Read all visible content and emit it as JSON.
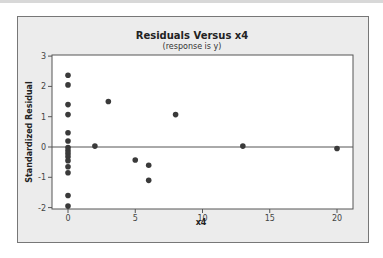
{
  "chart_data": {
    "type": "scatter",
    "title": "Residuals Versus x4",
    "subtitle": "(response is y)",
    "xlabel": "x4",
    "ylabel": "Standardized Residual",
    "xlim": [
      -1.2,
      21.2
    ],
    "ylim": [
      -2.1,
      3
    ],
    "xticks": [
      0,
      5,
      10,
      15,
      20
    ],
    "yticks": [
      -2,
      -1,
      0,
      1,
      2,
      3
    ],
    "reference_line_y": 0,
    "grid": false,
    "points": [
      {
        "x": 0,
        "y": 2.37
      },
      {
        "x": 0,
        "y": 2.05
      },
      {
        "x": 0,
        "y": 1.4
      },
      {
        "x": 0,
        "y": 1.07
      },
      {
        "x": 0,
        "y": 0.47
      },
      {
        "x": 0,
        "y": 0.2
      },
      {
        "x": 0,
        "y": -0.02
      },
      {
        "x": 0,
        "y": -0.12
      },
      {
        "x": 0,
        "y": -0.22
      },
      {
        "x": 0,
        "y": -0.32
      },
      {
        "x": 0,
        "y": -0.45
      },
      {
        "x": 0,
        "y": -0.65
      },
      {
        "x": 0,
        "y": -0.85
      },
      {
        "x": 0,
        "y": -1.6
      },
      {
        "x": 0,
        "y": -1.95
      },
      {
        "x": 2,
        "y": 0.03
      },
      {
        "x": 3,
        "y": 1.5
      },
      {
        "x": 5,
        "y": -0.43
      },
      {
        "x": 6,
        "y": -0.6
      },
      {
        "x": 6,
        "y": -1.1
      },
      {
        "x": 8,
        "y": 1.07
      },
      {
        "x": 13,
        "y": 0.03
      },
      {
        "x": 20,
        "y": -0.05
      }
    ]
  },
  "colors": {
    "frame_bg": "#ececec",
    "plot_bg": "#ffffff",
    "point": "#3a3a3a",
    "axis": "#555555"
  }
}
